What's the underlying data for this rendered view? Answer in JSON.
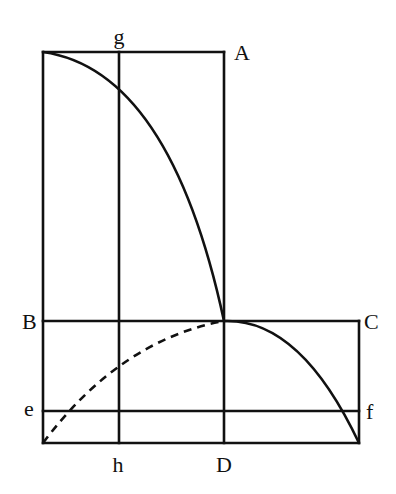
{
  "diagram": {
    "type": "geometric-construction",
    "background": "#ffffff",
    "stroke_color": "#111111",
    "labels": {
      "g": "g",
      "A": "A",
      "B": "B",
      "C": "C",
      "e": "e",
      "f": "f",
      "h": "h",
      "D": "D"
    },
    "elements": [
      {
        "name": "upper-rectangle",
        "desc": "tall rectangle from top-left corner to A and down to D"
      },
      {
        "name": "lower-rectangle",
        "desc": "rectangle B–C–bottom-right–bottom-left"
      },
      {
        "name": "line-gh",
        "desc": "vertical line from g to h"
      },
      {
        "name": "line-AD",
        "desc": "vertical line from A to D"
      },
      {
        "name": "line-BC",
        "desc": "horizontal line from B to C"
      },
      {
        "name": "line-ef",
        "desc": "horizontal line from e to f"
      },
      {
        "name": "solid-curve-upper",
        "desc": "parabolic curve from top-left corner to intersection of AD and BC"
      },
      {
        "name": "solid-curve-lower",
        "desc": "parabolic curve from intersection of AD and BC to bottom-right corner"
      },
      {
        "name": "dashed-curve",
        "desc": "dashed curve from bottom-left corner to intersection of AD and BC"
      }
    ]
  }
}
